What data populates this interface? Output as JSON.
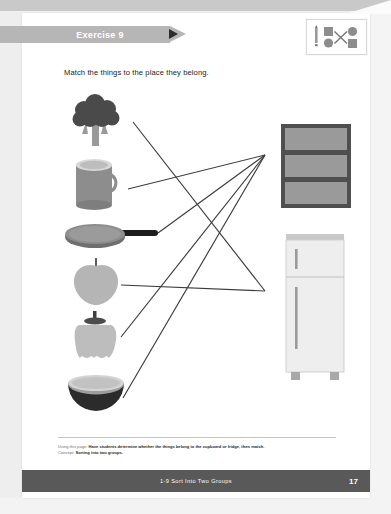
{
  "page": {
    "banner_label": "Exercise 9",
    "instruction": "Match the things to the place they belong.",
    "footer_note_lead": "Using this page:",
    "footer_note_body": "Have students determine whether the things belong to the cupboard or fridge, then match.",
    "footer_concept_lead": "Concept:",
    "footer_concept_body": "Sorting into two groups.",
    "footer_title": "1-9  Sort Into Two Groups",
    "footer_page_number": "17"
  },
  "icon_card": {
    "name": "match-pairs-icon",
    "pencil": "pencil-icon",
    "shapes": [
      "square",
      "circle",
      "circle",
      "square"
    ]
  },
  "left_objects": [
    {
      "id": "broccoli",
      "name": "broccoli-illustration",
      "label": "broccoli",
      "x": 68,
      "y": 94,
      "w": 56,
      "h": 52
    },
    {
      "id": "mug",
      "name": "mug-illustration",
      "label": "mug",
      "x": 68,
      "y": 155,
      "w": 56,
      "h": 52
    },
    {
      "id": "frying-pan",
      "name": "frying-pan-illustration",
      "label": "frying pan",
      "x": 68,
      "y": 221,
      "w": 90,
      "h": 34
    },
    {
      "id": "apple",
      "name": "apple-illustration",
      "label": "apple",
      "x": 72,
      "y": 259,
      "w": 48,
      "h": 48
    },
    {
      "id": "pepper",
      "name": "pepper-illustration",
      "label": "bell pepper",
      "x": 72,
      "y": 314,
      "w": 46,
      "h": 50
    },
    {
      "id": "bowl",
      "name": "bowl-illustration",
      "label": "bowl",
      "x": 68,
      "y": 375,
      "w": 56,
      "h": 42
    }
  ],
  "right_objects": [
    {
      "id": "cupboard",
      "name": "cupboard-illustration",
      "label": "cupboard",
      "x": 280,
      "y": 123,
      "w": 72,
      "h": 86
    },
    {
      "id": "fridge",
      "name": "fridge-illustration",
      "label": "fridge",
      "x": 282,
      "y": 235,
      "w": 66,
      "h": 145
    }
  ],
  "connections": [
    {
      "from": "broccoli",
      "to": "fridge",
      "x1": 133,
      "y1": 122,
      "x2": 265,
      "y2": 291
    },
    {
      "from": "mug",
      "to": "cupboard",
      "x1": 128,
      "y1": 189,
      "x2": 265,
      "y2": 155
    },
    {
      "from": "frying-pan",
      "to": "cupboard",
      "x1": 158,
      "y1": 233,
      "x2": 265,
      "y2": 155
    },
    {
      "from": "apple",
      "to": "fridge",
      "x1": 121,
      "y1": 285,
      "x2": 265,
      "y2": 291
    },
    {
      "from": "pepper",
      "to": "cupboard",
      "x1": 121,
      "y1": 337,
      "x2": 265,
      "y2": 155
    },
    {
      "from": "bowl",
      "to": "cupboard",
      "x1": 123,
      "y1": 398,
      "x2": 265,
      "y2": 155
    }
  ],
  "colors": {
    "banner": "#b6b6b6",
    "footer_bar": "#595959",
    "line": "#3c3c3c",
    "dark_object": "#444444",
    "mid_object": "#8d8d8d",
    "light_object": "#c9c9c9",
    "page_background": "#ffffff"
  }
}
